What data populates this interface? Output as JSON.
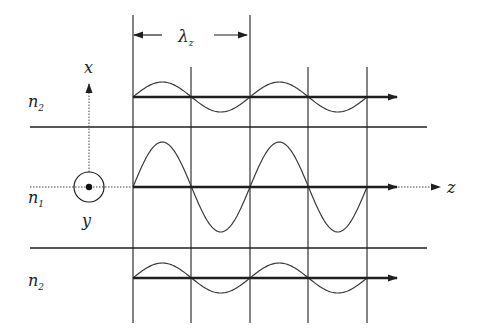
{
  "colors": {
    "line": "#1f1f1f",
    "wave": "#3a3a3a",
    "background": "#ffffff"
  },
  "labels": {
    "lambda": "λ",
    "lambda_sub": "z",
    "x_axis": "x",
    "y_axis": "y",
    "z_axis": "z",
    "n2_top": "n",
    "n2_top_sub": "2",
    "n1": "n",
    "n1_sub": "1",
    "n2_bottom": "n",
    "n2_bottom_sub": "2"
  },
  "geometry": {
    "verticals_x": [
      133,
      191,
      250,
      308,
      367
    ],
    "tall_verticals_top": 15,
    "short_verticals_top": 67,
    "verticals_bottom": 323,
    "interfaces_y": [
      127,
      248
    ],
    "interface_x_start": 30,
    "interface_x_end": 427,
    "lambda_arrow_y": 35,
    "guides": [
      {
        "name": "top-cladding",
        "axis_y": 97,
        "amplitude": 15,
        "arrow_end": 397
      },
      {
        "name": "core",
        "axis_y": 187,
        "amplitude": 45,
        "arrow_end": 397
      },
      {
        "name": "bottom-cladding",
        "axis_y": 278,
        "amplitude": 15,
        "arrow_end": 397
      }
    ],
    "origin": {
      "x": 89,
      "y": 187,
      "r": 15
    }
  }
}
